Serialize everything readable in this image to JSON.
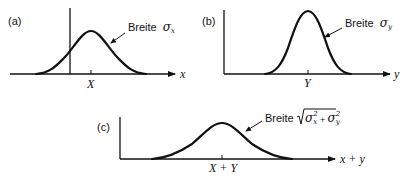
{
  "panels": [
    {
      "id": "a",
      "label": "(a)",
      "axis_label": "x",
      "mean_label": "X",
      "width_annotation": {
        "prefix": "Breite",
        "symbol": "σ",
        "subscript": "x"
      }
    },
    {
      "id": "b",
      "label": "(b)",
      "axis_label": "y",
      "mean_label": "Y",
      "width_annotation": {
        "prefix": "Breite",
        "symbol": "σ",
        "subscript": "y"
      }
    },
    {
      "id": "c",
      "label": "(c)",
      "axis_label": "x + y",
      "mean_label": "X + Y",
      "width_annotation": {
        "prefix": "Breite",
        "symbol_1": "σ",
        "subscript_1": "x",
        "superscript_1": "2",
        "plus": "+",
        "symbol_2": "σ",
        "subscript_2": "y",
        "superscript_2": "2"
      }
    }
  ],
  "colors": {
    "ink": "#111111",
    "background": "#ffffff"
  }
}
